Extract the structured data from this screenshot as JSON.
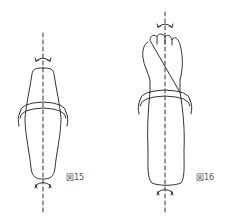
{
  "figures": [
    {
      "id": "fig15",
      "label": "図15",
      "subject": "forearm-rotation-axis"
    },
    {
      "id": "fig16",
      "label": "図16",
      "subject": "fist-forearm-rotation-axis"
    }
  ],
  "colors": {
    "line": "#333333",
    "label": "#555555",
    "background": "#ffffff"
  }
}
